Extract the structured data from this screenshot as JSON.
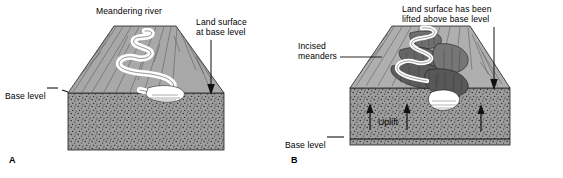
{
  "figure": {
    "type": "block-diagram-pair",
    "background_color": "#ffffff"
  },
  "panel_a": {
    "panel_letter": "A",
    "labels": {
      "title": "Meandering river",
      "land_surface": "Land surface\nat base level",
      "base_level": "Base level"
    },
    "colors": {
      "floodplain": "#a8a8a8",
      "bedrock": "#9a9a9a",
      "river": "#ffffff",
      "outline": "#1a1a1a"
    }
  },
  "panel_b": {
    "panel_letter": "B",
    "labels": {
      "land_surface": "Land surface has been\nlifted above base level",
      "incised_meanders": "Incised\nmeanders",
      "uplift": "Uplift",
      "base_level": "Base level"
    },
    "colors": {
      "upland": "#b0b0b0",
      "canyon_wall": "#6d6d6d",
      "canyon_shadow": "#4f4f4f",
      "bedrock": "#9a9a9a",
      "river": "#ffffff",
      "outline": "#1a1a1a"
    },
    "uplift_arrow_count": 3
  }
}
